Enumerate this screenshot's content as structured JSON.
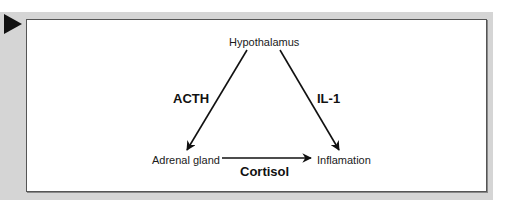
{
  "diagram": {
    "nodes": {
      "hypothalamus": "Hypothalamus",
      "adrenal_gland": "Adrenal gland",
      "inflammation": "Inflamation"
    },
    "edges": {
      "hypothalamus_to_adrenal": "ACTH",
      "hypothalamus_to_inflammation": "IL-1",
      "adrenal_to_inflammation": "Cortisol"
    },
    "icons": {
      "marker": "play-triangle-icon"
    },
    "colors": {
      "frame": "#d5d5d5",
      "panel": "#ffffff",
      "ink": "#111111"
    }
  }
}
